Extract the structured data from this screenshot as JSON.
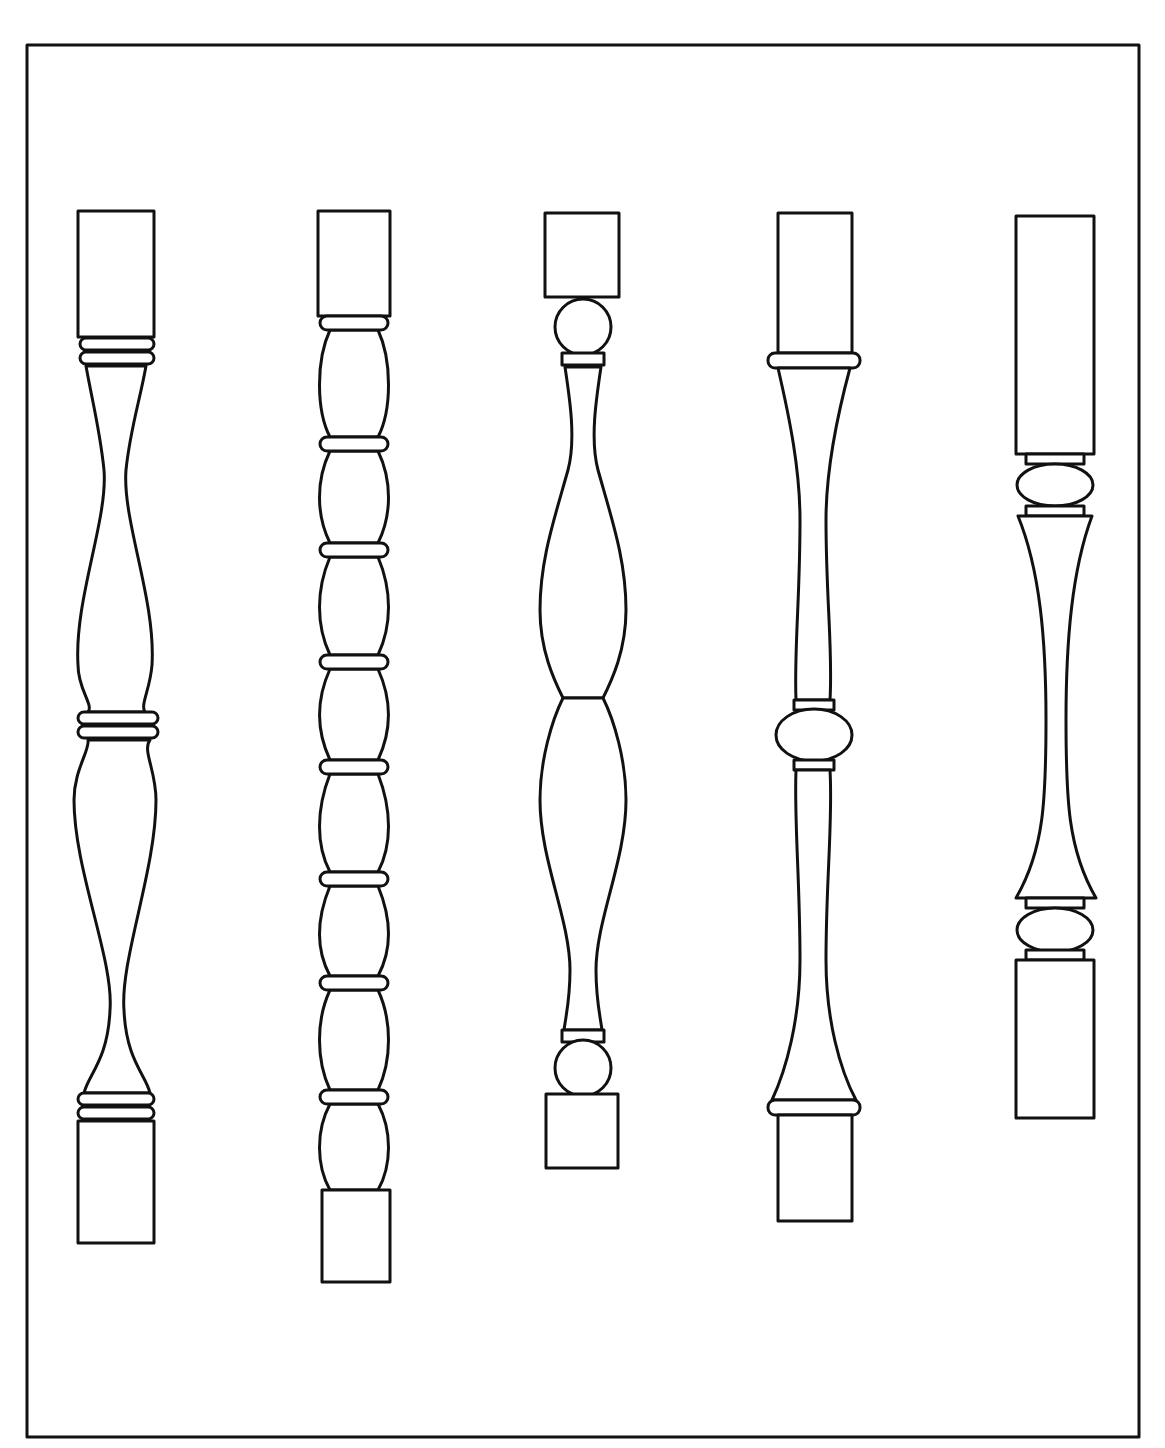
{
  "figure": {
    "frame_color": "#111111",
    "background": "#ffffff",
    "balusters": [
      {
        "index": 1,
        "style": "double-vase with ring collars"
      },
      {
        "index": 2,
        "style": "bobbin / spool-turned with repeating rings"
      },
      {
        "index": 3,
        "style": "double-vase with ball ends"
      },
      {
        "index": 4,
        "style": "tapered with central ball"
      },
      {
        "index": 5,
        "style": "long square top, ball collars, tapered shaft"
      }
    ]
  }
}
